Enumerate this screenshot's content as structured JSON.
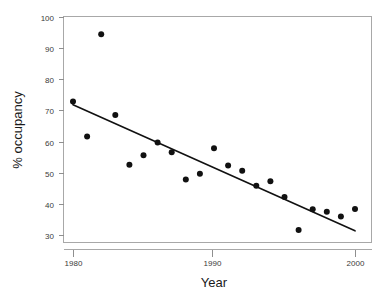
{
  "chart_data": {
    "type": "scatter",
    "title": "",
    "subtitle": "",
    "xlabel": "Year",
    "ylabel": "% occupancy",
    "xlim": [
      1979.0,
      2000.9
    ],
    "ylim": [
      29.0,
      100.5
    ],
    "xticks": [
      1980,
      1990,
      2000
    ],
    "xtick_labels": [
      "1980",
      "1990",
      "2000"
    ],
    "yticks": [
      30,
      40,
      50,
      60,
      70,
      80,
      90,
      100
    ],
    "ytick_labels": [
      "30",
      "40",
      "50",
      "60",
      "70",
      "80",
      "90",
      "100"
    ],
    "grid": false,
    "legend": null,
    "legend_position": "none",
    "point_color": "#111111",
    "point_size": 3.0,
    "line_color": "#111111",
    "frame_color": "#a8a8a8",
    "background_color": "#ffffff",
    "series": [
      {
        "name": "observations",
        "type": "scatter",
        "x": [
          1980,
          1981,
          1982,
          1983,
          1984,
          1985,
          1986,
          1987,
          1988,
          1989,
          1990,
          1991,
          1992,
          1993,
          1994,
          1995,
          1996,
          1997,
          1998,
          1999,
          2000
        ],
        "y": [
          73.0,
          61.8,
          94.6,
          68.7,
          52.7,
          55.8,
          59.9,
          56.7,
          48.0,
          49.8,
          58.0,
          52.5,
          50.8,
          46.0,
          47.4,
          42.4,
          31.8,
          38.4,
          37.6,
          36.1,
          38.5
        ]
      },
      {
        "name": "linear fit",
        "type": "line",
        "x": [
          1980,
          2000
        ],
        "y": [
          72.0,
          31.5
        ]
      }
    ],
    "annotations": []
  },
  "axes": {
    "x_axis_label": "Year",
    "y_axis_label": "% occupancy"
  }
}
